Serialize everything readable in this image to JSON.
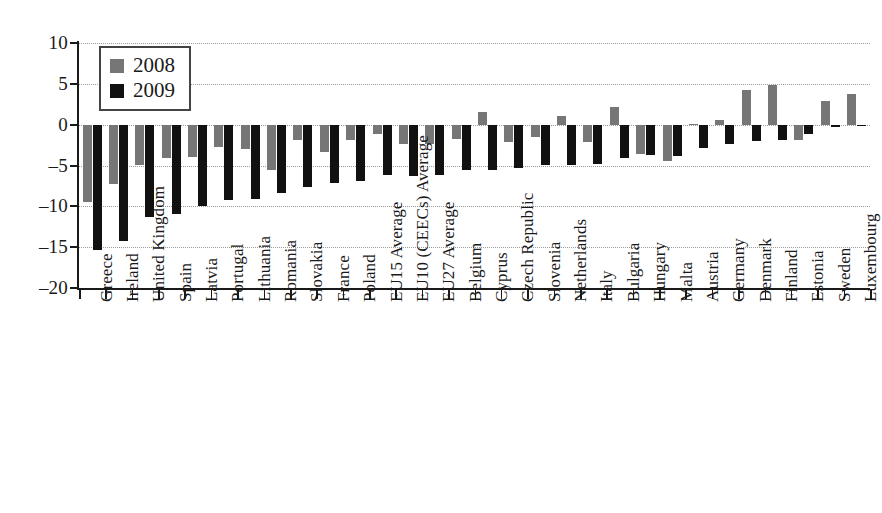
{
  "chart_data": {
    "type": "bar",
    "title": "",
    "subtitle": "",
    "xlabel": "",
    "ylabel": "",
    "ylim": [
      -20,
      10
    ],
    "yticks": [
      10,
      5,
      0,
      -5,
      -10,
      -15,
      -20
    ],
    "ytick_labels": [
      "10",
      "5",
      "0",
      "–5",
      "–10",
      "–15",
      "–20"
    ],
    "grid": true,
    "grid_style": "dotted",
    "legend_position": "top-left",
    "legend": [
      "2008",
      "2009"
    ],
    "colors": {
      "2008": "#767676",
      "2009": "#111111"
    },
    "categories": [
      "Greece",
      "Ireland",
      "United Kingdom",
      "Spain",
      "Latvia",
      "Portugal",
      "Lithuania",
      "Romania",
      "Slovakia",
      "France",
      "Poland",
      "EU15 Average",
      "EU10 (CEECs) Average",
      "EU27 Average",
      "Belgium",
      "Cyprus",
      "Czech Republic",
      "Slovenia",
      "Netherlands",
      "Italy",
      "Bulgaria",
      "Hungary",
      "Malta",
      "Austria",
      "Germany",
      "Denmark",
      "Finland",
      "Estonia",
      "Sweden",
      "Luxembourg"
    ],
    "series": [
      {
        "name": "2008",
        "values": [
          -9.5,
          -7.3,
          -5.0,
          -4.1,
          -4.0,
          -2.7,
          -3.0,
          -5.5,
          -1.9,
          -3.3,
          -1.9,
          -1.2,
          -2.4,
          -2.4,
          -1.7,
          1.5,
          -2.1,
          -1.5,
          1.1,
          -2.1,
          2.2,
          -3.6,
          -4.4,
          0.1,
          0.6,
          4.2,
          4.8,
          -1.9,
          2.9,
          3.7
        ]
      },
      {
        "name": "2009",
        "values": [
          -15.3,
          -14.3,
          -11.3,
          -11.0,
          -10.0,
          -9.2,
          -9.1,
          -8.4,
          -7.6,
          -7.2,
          -6.9,
          -6.2,
          -6.3,
          -6.2,
          -5.5,
          -5.5,
          -5.3,
          -5.0,
          -4.9,
          -4.8,
          -4.1,
          -3.7,
          -3.8,
          -2.8,
          -2.4,
          -2.0,
          -1.9,
          -1.1,
          -0.3,
          -0.1
        ]
      }
    ]
  },
  "legend": {
    "items": [
      {
        "label": "2008",
        "color": "#767676",
        "swatch": "legend-swatch-2008"
      },
      {
        "label": "2009",
        "color": "#111111",
        "swatch": "legend-swatch-2009"
      }
    ]
  }
}
